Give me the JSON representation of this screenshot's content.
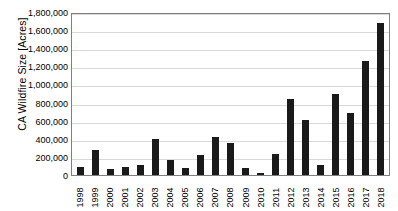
{
  "chart_data": {
    "type": "bar",
    "title": "",
    "xlabel": "",
    "ylabel": "CA Wildfire Size [Acres]",
    "ylim": [
      0,
      1800000
    ],
    "grid": true,
    "legend": null,
    "bar_color": "#1a1a1a",
    "gridline_color": "#d9d9d9",
    "axis_color": "#7f7f7f",
    "y_ticks": [
      "1,800,000",
      "1,600,000",
      "1,400,000",
      "1,200,000",
      "1,000,000",
      "800,000",
      "600,000",
      "400,000",
      "200,000",
      "0"
    ],
    "y_tick_values": [
      1800000,
      1600000,
      1400000,
      1200000,
      1000000,
      800000,
      600000,
      400000,
      200000,
      0
    ],
    "categories": [
      "1998",
      "1999",
      "2000",
      "2001",
      "2002",
      "2003",
      "2004",
      "2005",
      "2006",
      "2007",
      "2008",
      "2009",
      "2010",
      "2011",
      "2012",
      "2013",
      "2014",
      "2015",
      "2016",
      "2017",
      "2018"
    ],
    "values": [
      90000,
      280000,
      68000,
      90000,
      115000,
      400000,
      170000,
      75000,
      225000,
      425000,
      350000,
      80000,
      20000,
      235000,
      840000,
      610000,
      112000,
      890000,
      680000,
      1255000,
      1680000
    ]
  }
}
